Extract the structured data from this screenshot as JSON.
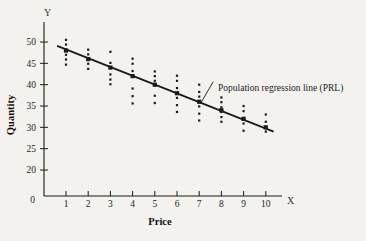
{
  "figure": {
    "background": "#f3f2ef",
    "ink": "#1a1a1a"
  },
  "labels": {
    "y_axis_name": "Y",
    "x_axis_name": "X",
    "y_axis_title": "Quantity",
    "x_axis_title": "Price",
    "annotation": "Population regression line (PRL)"
  },
  "chart_data": {
    "type": "scatter",
    "title": "",
    "subtitle": "",
    "xlabel": "Price",
    "ylabel": "Quantity",
    "x_axis_symbol": "X",
    "y_axis_symbol": "Y",
    "xlim": [
      0,
      10.8
    ],
    "ylim": [
      0,
      52
    ],
    "xticks": [
      1,
      2,
      3,
      4,
      5,
      6,
      7,
      8,
      9,
      10
    ],
    "xticklabels": [
      "1",
      "2",
      "3",
      "4",
      "5",
      "6",
      "7",
      "8",
      "9",
      "10"
    ],
    "yticks": [
      20,
      25,
      30,
      35,
      40,
      45,
      50
    ],
    "yticklabels": [
      "20",
      "25",
      "30",
      "35",
      "40",
      "45",
      "50"
    ],
    "origin_label": "0",
    "grid": false,
    "legend": false,
    "annotations": [
      {
        "text": "Population regression line (PRL)",
        "x": 7.9,
        "y": 40.2,
        "points_to_x": 7.05,
        "points_to_y": 35.5
      }
    ],
    "series": [
      {
        "name": "Population regression line (PRL)",
        "type": "line",
        "x": [
          0.6,
          10.35
        ],
        "y": [
          49.1,
          29.0
        ],
        "slope": -2.06,
        "intercept": 50.35,
        "color": "#1a1a1a"
      },
      {
        "name": "Conditional means E(Y|X)",
        "type": "scatter",
        "marker": "square",
        "x": [
          1,
          2,
          3,
          4,
          5,
          6,
          7,
          8,
          9,
          10
        ],
        "y": [
          48.0,
          46.0,
          44.0,
          42.0,
          40.0,
          38.0,
          36.0,
          34.0,
          32.0,
          30.0
        ],
        "color": "#1a1a1a"
      },
      {
        "name": "Observed Y values",
        "type": "scatter",
        "marker": "dot",
        "color": "#1a1a1a",
        "points": [
          {
            "x": 1,
            "y": 50.5
          },
          {
            "x": 1,
            "y": 49.4
          },
          {
            "x": 1,
            "y": 48.2
          },
          {
            "x": 1,
            "y": 47.0
          },
          {
            "x": 1,
            "y": 45.9
          },
          {
            "x": 1,
            "y": 44.7
          },
          {
            "x": 2,
            "y": 48.2
          },
          {
            "x": 2,
            "y": 47.1
          },
          {
            "x": 2,
            "y": 46.0
          },
          {
            "x": 2,
            "y": 44.9
          },
          {
            "x": 2,
            "y": 43.7
          },
          {
            "x": 3,
            "y": 47.7
          },
          {
            "x": 3,
            "y": 45.1
          },
          {
            "x": 3,
            "y": 44.0
          },
          {
            "x": 3,
            "y": 42.4
          },
          {
            "x": 3,
            "y": 41.2
          },
          {
            "x": 3,
            "y": 40.1
          },
          {
            "x": 4,
            "y": 46.1
          },
          {
            "x": 4,
            "y": 44.9
          },
          {
            "x": 4,
            "y": 43.2
          },
          {
            "x": 4,
            "y": 42.0
          },
          {
            "x": 4,
            "y": 39.1
          },
          {
            "x": 4,
            "y": 37.3
          },
          {
            "x": 4,
            "y": 35.6
          },
          {
            "x": 5,
            "y": 43.1
          },
          {
            "x": 5,
            "y": 42.0
          },
          {
            "x": 5,
            "y": 40.9
          },
          {
            "x": 5,
            "y": 39.8
          },
          {
            "x": 5,
            "y": 37.4
          },
          {
            "x": 5,
            "y": 35.7
          },
          {
            "x": 6,
            "y": 42.1
          },
          {
            "x": 6,
            "y": 40.9
          },
          {
            "x": 6,
            "y": 39.2
          },
          {
            "x": 6,
            "y": 38.0
          },
          {
            "x": 6,
            "y": 36.9
          },
          {
            "x": 6,
            "y": 35.2
          },
          {
            "x": 6,
            "y": 33.6
          },
          {
            "x": 7,
            "y": 40.0
          },
          {
            "x": 7,
            "y": 38.3
          },
          {
            "x": 7,
            "y": 37.2
          },
          {
            "x": 7,
            "y": 36.0
          },
          {
            "x": 7,
            "y": 34.9
          },
          {
            "x": 7,
            "y": 33.2
          },
          {
            "x": 7,
            "y": 31.6
          },
          {
            "x": 8,
            "y": 37.0
          },
          {
            "x": 8,
            "y": 35.9
          },
          {
            "x": 8,
            "y": 34.7
          },
          {
            "x": 8,
            "y": 33.6
          },
          {
            "x": 8,
            "y": 32.4
          },
          {
            "x": 8,
            "y": 31.3
          },
          {
            "x": 9,
            "y": 35.0
          },
          {
            "x": 9,
            "y": 33.8
          },
          {
            "x": 9,
            "y": 32.1
          },
          {
            "x": 9,
            "y": 30.9
          },
          {
            "x": 9,
            "y": 29.2
          },
          {
            "x": 10,
            "y": 33.0
          },
          {
            "x": 10,
            "y": 31.3
          },
          {
            "x": 10,
            "y": 30.1
          },
          {
            "x": 10,
            "y": 29.0
          }
        ]
      }
    ]
  }
}
